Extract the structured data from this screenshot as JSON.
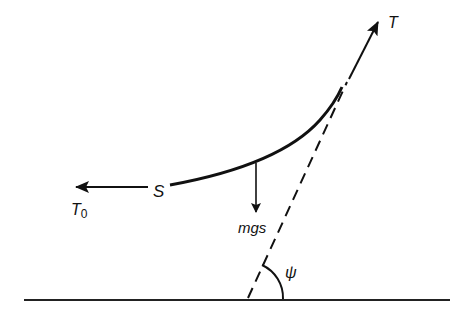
{
  "diagram": {
    "type": "free-body diagram of cable segment",
    "labels": {
      "tension_end": "T",
      "tension_start": "T",
      "tension_start_subscript": "0",
      "point": "S",
      "weight": "mgs",
      "angle": "ψ"
    },
    "elements": [
      {
        "name": "ground-line",
        "kind": "line"
      },
      {
        "name": "cable-curve",
        "kind": "curve",
        "from": "S",
        "to": "upper end"
      },
      {
        "name": "tension-T-arrow",
        "kind": "arrow",
        "direction": "up-right along tangent"
      },
      {
        "name": "tension-T0-arrow",
        "kind": "arrow",
        "direction": "left"
      },
      {
        "name": "weight-arrow",
        "kind": "arrow",
        "direction": "down"
      },
      {
        "name": "tangent-dashed-line",
        "kind": "dashed line",
        "meets": "ground"
      },
      {
        "name": "angle-arc",
        "kind": "arc",
        "label": "ψ"
      }
    ],
    "colors": {
      "stroke": "#111111",
      "background": "#ffffff"
    }
  }
}
